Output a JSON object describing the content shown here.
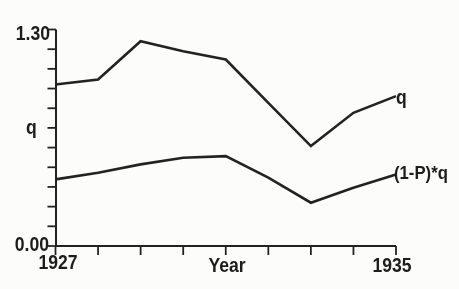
{
  "figure": {
    "ink_color": "#242424",
    "text_color": "#1d1d1d",
    "background": "#fcfcfa"
  },
  "labels": {
    "y_max": "1.30",
    "y_min": "0.00",
    "y_title": "q",
    "x_first": "1927",
    "x_title": "Year",
    "x_last": "1935",
    "series_upper": "q",
    "series_lower": "(1-P)*q"
  },
  "chart_data": {
    "type": "line",
    "title": "",
    "xlabel": "Year",
    "ylabel": "q",
    "x": [
      1927,
      1928,
      1929,
      1930,
      1931,
      1932,
      1933,
      1934,
      1935
    ],
    "series": [
      {
        "name": "q",
        "values": [
          0.97,
          1.0,
          1.23,
          1.17,
          1.12,
          0.86,
          0.6,
          0.8,
          0.9
        ]
      },
      {
        "name": "(1-P)*q",
        "values": [
          0.4,
          0.44,
          0.49,
          0.53,
          0.54,
          0.41,
          0.26,
          0.35,
          0.43
        ]
      }
    ],
    "xlim": [
      1927,
      1935
    ],
    "ylim": [
      0.0,
      1.3
    ],
    "y_tick_count": 12,
    "x_tick_count": 9,
    "grid": false,
    "legend": "inline labels at right end of each line"
  }
}
